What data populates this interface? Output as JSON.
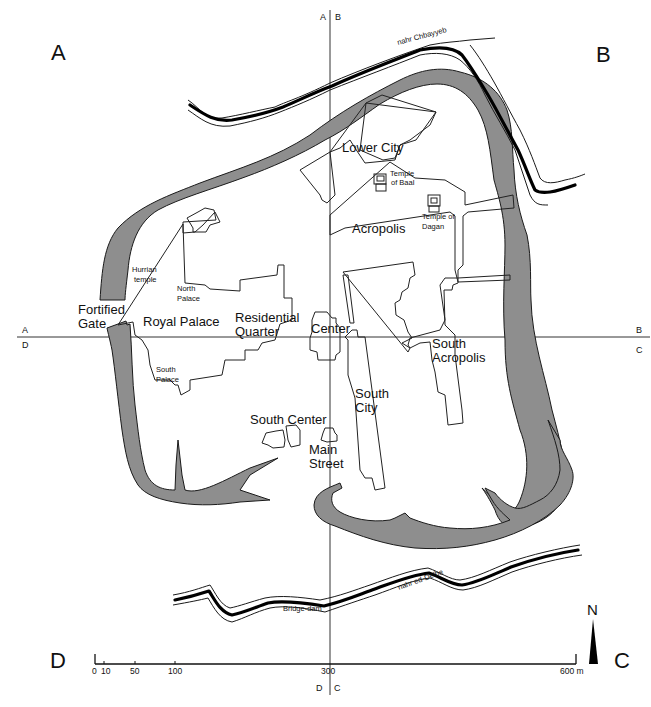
{
  "map": {
    "quadrant_labels": {
      "A": "A",
      "B": "B",
      "C": "C",
      "D": "D"
    },
    "grid_labels": {
      "top_left": "A",
      "top_right": "B",
      "left_upper": "A",
      "left_lower": "D",
      "right_upper": "B",
      "right_lower": "C",
      "bottom_left": "D",
      "bottom_right": "C"
    },
    "rivers": {
      "north": "nahr Chbayyeb",
      "south": "nahr ed-Delbe"
    },
    "features": {
      "lower_city": "Lower City",
      "temple_of_baal_1": "Temple",
      "temple_of_baal_2": "of Baal",
      "temple_of_dagan_1": "Temple of",
      "temple_of_dagan_2": "Dagan",
      "acropolis": "Acropolis",
      "hurrian_temple_1": "Hurrian",
      "hurrian_temple_2": "temple",
      "north_palace_1": "North",
      "north_palace_2": "Palace",
      "fortified_gate_1": "Fortified",
      "fortified_gate_2": "Gate",
      "royal_palace": "Royal Palace",
      "residential_quarter_1": "Residential",
      "residential_quarter_2": "Quarter",
      "center": "Center",
      "south_palace_1": "South",
      "south_palace_2": "Palace",
      "south_acropolis_1": "South",
      "south_acropolis_2": "Acropolis",
      "south_city_1": "South",
      "south_city_2": "City",
      "south_center": "South Center",
      "main_street_1": "Main",
      "main_street_2": "Street",
      "bridge_dam": "Bridge-dam"
    },
    "scale_bar": {
      "ticks": [
        "0",
        "10",
        "50",
        "100",
        "300",
        "600 m"
      ],
      "unit": "m"
    },
    "north_arrow": {
      "label": "N"
    },
    "colors": {
      "rampart_fill": "#8e8e8e",
      "line": "#222222",
      "background": "#ffffff"
    }
  }
}
